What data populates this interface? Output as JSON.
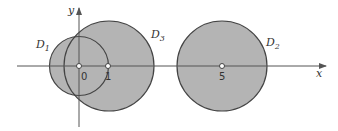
{
  "diagram": {
    "type": "disks-in-plane",
    "axes": {
      "x_label": "x",
      "y_label": "y"
    },
    "colors": {
      "fill": "#b4b4b4",
      "stroke": "#444444",
      "axis": "#555555",
      "background": "#ffffff"
    },
    "disks": [
      {
        "name": "D",
        "sub": "1",
        "center": 0,
        "radius": 1
      },
      {
        "name": "D",
        "sub": "2",
        "center": 5,
        "radius": 1.55
      },
      {
        "name": "D",
        "sub": "3",
        "center": 1.05,
        "radius": 1.55
      }
    ],
    "points": [
      {
        "label": "0",
        "x": 0
      },
      {
        "label": "1",
        "x": 1
      },
      {
        "label": "5",
        "x": 5
      }
    ]
  }
}
